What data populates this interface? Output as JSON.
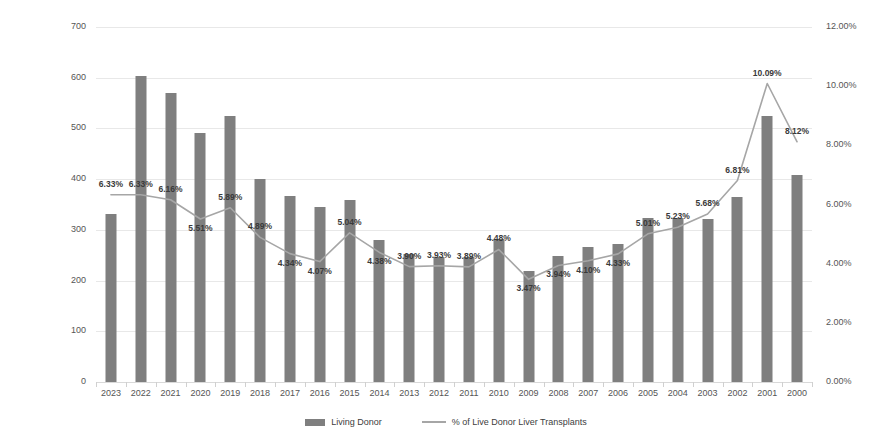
{
  "chart_data": {
    "type": "bar",
    "title": "",
    "subtitle": "",
    "xlabel": "",
    "ylabel": "",
    "grid": true,
    "legend_position": "bottom",
    "categories": [
      "2023",
      "2022",
      "2021",
      "2020",
      "2019",
      "2018",
      "2017",
      "2016",
      "2015",
      "2014",
      "2013",
      "2012",
      "2011",
      "2010",
      "2009",
      "2008",
      "2007",
      "2006",
      "2005",
      "2004",
      "2003",
      "2002",
      "2001",
      "2000"
    ],
    "axes": {
      "left": {
        "label": "",
        "ylim": [
          0,
          700
        ],
        "tick_step": 100,
        "ticks": [
          "700",
          "600",
          "500",
          "400",
          "300",
          "200",
          "100",
          "0"
        ],
        "tick_values": [
          700,
          600,
          500,
          400,
          300,
          200,
          100,
          0
        ]
      },
      "right": {
        "label": "",
        "ylim": [
          0,
          12
        ],
        "tick_step": 2,
        "ticks": [
          "12.00%",
          "10.00%",
          "8.00%",
          "6.00%",
          "4.00%",
          "2.00%",
          "0.00%"
        ],
        "tick_values": [
          12,
          10,
          8,
          6,
          4,
          2,
          0
        ]
      }
    },
    "series": [
      {
        "name": "Living Donor",
        "type": "bar",
        "axis": "left",
        "color": "#7f7f7f",
        "values": [
          331,
          603,
          569,
          491,
          524,
          401,
          367,
          345,
          359,
          280,
          252,
          246,
          247,
          282,
          219,
          249,
          266,
          273,
          323,
          323,
          321,
          364,
          524,
          408
        ]
      },
      {
        "name": "% of Live Donor Liver Transplants",
        "type": "line",
        "axis": "right",
        "color": "#a6a6a6",
        "values": [
          6.33,
          6.33,
          6.16,
          5.51,
          5.89,
          4.89,
          4.34,
          4.07,
          5.04,
          4.38,
          3.9,
          3.93,
          3.89,
          4.48,
          3.47,
          3.94,
          4.1,
          4.33,
          5.01,
          5.23,
          5.68,
          6.81,
          10.09,
          8.12
        ],
        "labels": [
          "6.33%",
          "6.33%",
          "6.16%",
          "5.51%",
          "5.89%",
          "4.89%",
          "4.34%",
          "4.07%",
          "5.04%",
          "4.38%",
          "3.90%",
          "3.93%",
          "3.89%",
          "4.48%",
          "3.47%",
          "3.94%",
          "4.10%",
          "4.33%",
          "5.01%",
          "5.23%",
          "5.68%",
          "6.81%",
          "10.09%",
          "8.12%"
        ]
      }
    ]
  },
  "legend": {
    "items": [
      {
        "label": "Living Donor",
        "marker": "bar-swatch",
        "color": "#7f7f7f"
      },
      {
        "label": "% of Live Donor Liver Transplants",
        "marker": "line-swatch",
        "color": "#a6a6a6"
      }
    ]
  },
  "colors": {
    "bar": "#7f7f7f",
    "line": "#a6a6a6",
    "grid": "#e8e8e8",
    "text": "#555555",
    "label_text": "#3a3a3a",
    "background": "#ffffff"
  }
}
